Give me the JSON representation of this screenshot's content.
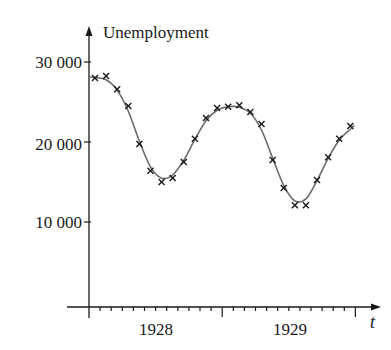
{
  "chart_data": {
    "type": "scatter",
    "title": "",
    "ylabel": "Unemployment",
    "xlabel": "t",
    "ylim": [
      0,
      30000
    ],
    "xlim": [
      1927.0,
      1929.75
    ],
    "y_ticks": [
      {
        "value": 10000,
        "label": "10 000"
      },
      {
        "value": 20000,
        "label": "20 000"
      },
      {
        "value": 30000,
        "label": "30 000"
      }
    ],
    "x_ticks": [
      {
        "value": 1927.5,
        "label": "1928"
      },
      {
        "value": 1928.5,
        "label": "1929"
      }
    ],
    "grid": false,
    "legend": null,
    "series": [
      {
        "name": "Observed monthly unemployment",
        "marker": "x",
        "x": [
          1,
          2,
          3,
          4,
          5,
          6,
          7,
          8,
          9,
          10,
          11,
          12,
          13,
          14,
          15,
          16,
          17,
          18,
          19,
          20,
          21,
          22,
          23,
          24
        ],
        "x_unit": "months from start (Jan 1927 axis origin)",
        "values": [
          28000,
          28250,
          26600,
          24500,
          19750,
          16400,
          15000,
          15500,
          17500,
          20400,
          23000,
          24250,
          24400,
          24600,
          23750,
          22250,
          17750,
          14250,
          12100,
          12100,
          15250,
          18100,
          20400,
          22000
        ]
      },
      {
        "name": "Fitted sinusoidal model",
        "type": "line",
        "model": "U(t) = a + b*cos(...) fitted curve through data"
      }
    ]
  },
  "plot": {
    "px": {
      "origin_x": 89,
      "zero_y": 302,
      "xaxis_y": 307,
      "px_per_month": 11.1,
      "px_per_10000": 80,
      "first_point_x": 95
    }
  }
}
